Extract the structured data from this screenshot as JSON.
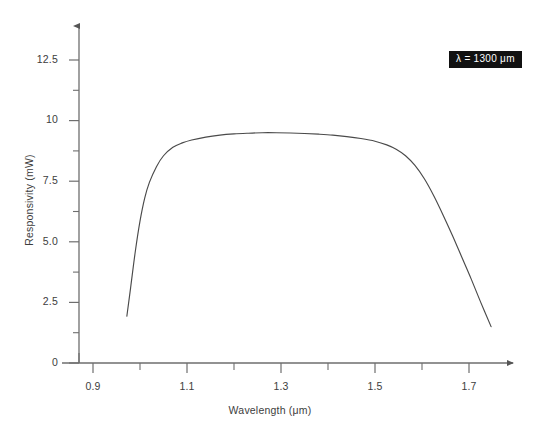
{
  "figure": {
    "background_color": "#ffffff",
    "axis_color": "#6e6e6e",
    "curve_color": "#4a4a4a",
    "text_color": "#3d3d3d"
  },
  "annotation": {
    "text": "λ = 1300 μm",
    "background_color": "#111111",
    "text_color": "#ffffff"
  },
  "axes": {
    "x_title": "Wavelength (μm)",
    "y_title": "Responsivity (mW)",
    "x_major_labels": [
      "0.9",
      "1.1",
      "1.3",
      "1.5",
      "1.7"
    ],
    "x_major_values": [
      0.9,
      1.1,
      1.3,
      1.5,
      1.7
    ],
    "x_minor_values": [
      1.0,
      1.2,
      1.4,
      1.6
    ],
    "y_major_labels": [
      "0",
      "2.5",
      "5.0",
      "7.5",
      "10",
      "12.5"
    ],
    "y_major_values": [
      0,
      2.5,
      5.0,
      7.5,
      10,
      12.5
    ],
    "y_minor_values": [
      1.25,
      3.75,
      6.25,
      8.75,
      11.25
    ]
  },
  "chart_data": {
    "type": "line",
    "title": "",
    "subtitle": "",
    "xlabel": "Wavelength (μm)",
    "ylabel": "Responsivity (mW)",
    "xlim": [
      0.85,
      1.78
    ],
    "ylim": [
      0,
      13.6
    ],
    "grid": false,
    "legend": false,
    "annotations": [
      {
        "text": "λ = 1300 μm",
        "position": "top-right"
      }
    ],
    "series": [
      {
        "name": "Responsivity",
        "color": "#4a4a4a",
        "x": [
          0.972,
          0.98,
          0.99,
          1.0,
          1.01,
          1.02,
          1.035,
          1.05,
          1.07,
          1.09,
          1.11,
          1.14,
          1.17,
          1.2,
          1.23,
          1.26,
          1.29,
          1.32,
          1.35,
          1.38,
          1.41,
          1.44,
          1.47,
          1.5,
          1.525,
          1.545,
          1.565,
          1.585,
          1.605,
          1.625,
          1.645,
          1.665,
          1.685,
          1.705,
          1.725,
          1.747
        ],
        "y": [
          1.93,
          3.1,
          4.6,
          5.85,
          6.8,
          7.45,
          8.1,
          8.55,
          8.9,
          9.08,
          9.2,
          9.32,
          9.4,
          9.45,
          9.48,
          9.5,
          9.5,
          9.49,
          9.47,
          9.44,
          9.4,
          9.34,
          9.26,
          9.15,
          9.0,
          8.82,
          8.55,
          8.15,
          7.6,
          6.9,
          6.1,
          5.25,
          4.35,
          3.45,
          2.5,
          1.5
        ]
      }
    ]
  }
}
